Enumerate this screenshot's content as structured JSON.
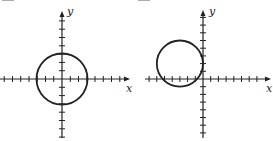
{
  "figures": [
    {
      "id": "left",
      "x_axis_label": "x",
      "y_axis_label": "y",
      "circle": {
        "center": [
          0,
          0
        ],
        "radius": 3
      },
      "x_ticks_range": [
        -7,
        6
      ],
      "y_ticks_range": [
        -8,
        8
      ]
    },
    {
      "id": "right",
      "x_axis_label": "x",
      "y_axis_label": "y",
      "circle": {
        "center": [
          -3,
          2
        ],
        "radius": 3
      },
      "x_ticks_range": [
        -7,
        8
      ],
      "y_ticks_range": [
        -8,
        8
      ]
    }
  ],
  "colors": {
    "ink": "#222222",
    "background": "#ffffff"
  }
}
